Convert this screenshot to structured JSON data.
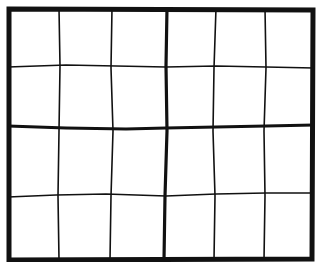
{
  "board": {
    "columns": 6,
    "rows": 4,
    "box_columns": 3,
    "box_rows": 2,
    "line_color": "#111111",
    "background": "#ffffff",
    "cells": [
      [
        "",
        "",
        "",
        "",
        "",
        ""
      ],
      [
        "",
        "",
        "",
        "",
        "",
        ""
      ],
      [
        "",
        "",
        "",
        "",
        "",
        ""
      ],
      [
        "",
        "",
        "",
        "",
        "",
        ""
      ]
    ]
  }
}
